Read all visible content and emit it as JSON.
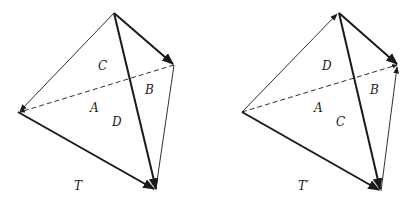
{
  "diagrams": [
    {
      "title": "T",
      "faces": {
        "A": "A",
        "B": "B",
        "C": "C",
        "D": "D"
      }
    },
    {
      "title": "T′",
      "faces": {
        "A": "A",
        "B": "B",
        "C": "C",
        "D": "D"
      }
    }
  ],
  "colors": {
    "stroke": "#1a1a1a",
    "background": "#ffffff"
  }
}
